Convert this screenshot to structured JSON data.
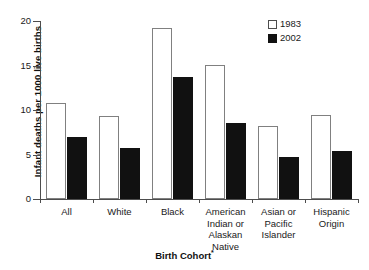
{
  "chart_data": {
    "type": "bar",
    "title": "",
    "xlabel": "Birth Cohort*",
    "ylabel": "Infant deaths per 1000 live births",
    "ylim": [
      0,
      20
    ],
    "yticks": [
      0,
      5,
      10,
      15,
      20
    ],
    "ytick_labels": [
      "0",
      "5",
      "10",
      "15",
      "20"
    ],
    "grid": false,
    "legend_position": "top-right",
    "categories": [
      "All",
      "White",
      "Black",
      "American Indian or Alaskan Native",
      "Asian or Pacific Islander",
      "Hispanic Origin"
    ],
    "category_label_lines": [
      [
        "All"
      ],
      [
        "White"
      ],
      [
        "Black"
      ],
      [
        "American",
        "Indian or",
        "Alaskan",
        "Native"
      ],
      [
        "Asian or",
        "Pacific",
        "Islander"
      ],
      [
        "Hispanic",
        "Origin"
      ]
    ],
    "series": [
      {
        "name": "1983",
        "color": "#ffffff",
        "edge_color": "#808080",
        "values": [
          10.8,
          9.3,
          19.2,
          15.1,
          8.2,
          9.4
        ]
      },
      {
        "name": "2002",
        "color": "#111111",
        "edge_color": "#111111",
        "values": [
          7.0,
          5.7,
          13.7,
          8.5,
          4.7,
          5.4
        ]
      }
    ]
  },
  "axis": {
    "y_title": "Infant deaths per 1000 live births",
    "x_title": "Birth Cohort",
    "x_title_note": "*"
  },
  "legend": {
    "items": [
      {
        "label": "1983",
        "swatch": "open-square"
      },
      {
        "label": "2002",
        "swatch": "filled-square"
      }
    ]
  }
}
